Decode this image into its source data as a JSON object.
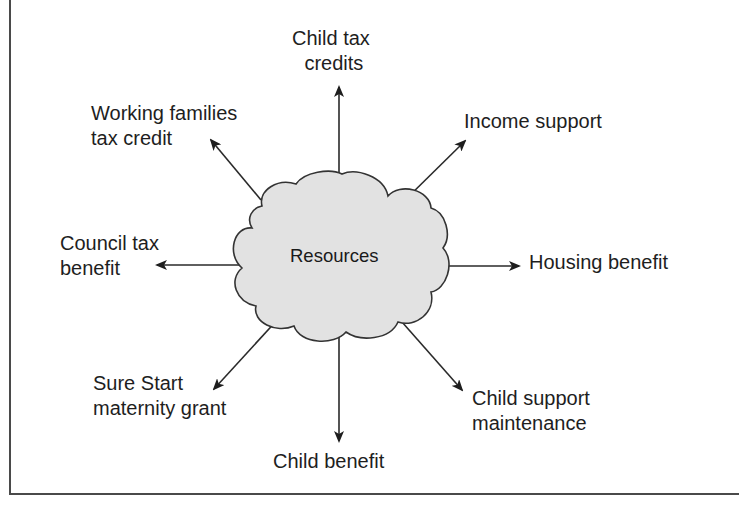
{
  "diagram": {
    "center": {
      "label": "Resources",
      "shape": "cloud",
      "fill": "#e2e2e2",
      "stroke": "#333333"
    },
    "nodes": [
      {
        "id": "child-tax-credits",
        "lines": [
          "Child tax",
          "credits"
        ],
        "direction": "up"
      },
      {
        "id": "income-support",
        "lines": [
          "Income support"
        ],
        "direction": "up-right"
      },
      {
        "id": "housing-benefit",
        "lines": [
          "Housing benefit"
        ],
        "direction": "right"
      },
      {
        "id": "child-support-maintenance",
        "lines": [
          "Child support",
          "maintenance"
        ],
        "direction": "down-right"
      },
      {
        "id": "child-benefit",
        "lines": [
          "Child benefit"
        ],
        "direction": "down"
      },
      {
        "id": "sure-start-maternity-grant",
        "lines": [
          "Sure Start",
          "maternity grant"
        ],
        "direction": "down-left"
      },
      {
        "id": "council-tax-benefit",
        "lines": [
          "Council tax",
          "benefit"
        ],
        "direction": "left"
      },
      {
        "id": "working-families-tax-credit",
        "lines": [
          "Working families",
          "tax credit"
        ],
        "direction": "up-left"
      }
    ],
    "colors": {
      "line": "#2a2a2a",
      "text": "#1e1e1e",
      "border": "#4a4a4a"
    }
  }
}
